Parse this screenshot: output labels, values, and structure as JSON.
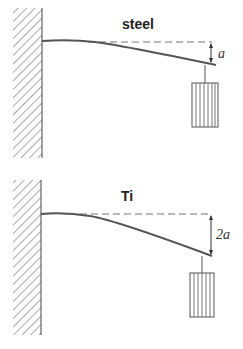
{
  "panels": [
    {
      "title": "steel",
      "deflection_label": "a"
    },
    {
      "title": "Ti",
      "deflection_label": "2a"
    }
  ],
  "colors": {
    "beam": "#555555",
    "wall_hatch": "#444444",
    "dashed_line": "#666666"
  }
}
